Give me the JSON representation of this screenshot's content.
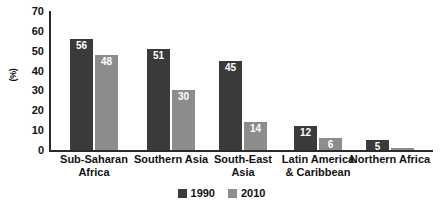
{
  "chart_data": {
    "type": "bar",
    "title": "",
    "xlabel": "",
    "ylabel": "(%)",
    "ylim": [
      0,
      70
    ],
    "yticks": [
      70,
      60,
      50,
      40,
      30,
      20,
      10,
      0
    ],
    "grid": false,
    "legend_position": "bottom-center",
    "categories": [
      "Sub-Saharan\nAfrica",
      "Southern Asia",
      "South-East\nAsia",
      "Latin America\n& Caribbean",
      "Northern Africa"
    ],
    "category_lines": [
      [
        "Sub-Saharan",
        "Africa"
      ],
      [
        "Southern Asia",
        ""
      ],
      [
        "South-East",
        "Asia"
      ],
      [
        "Latin America",
        "& Caribbean"
      ],
      [
        "Northern Africa",
        ""
      ]
    ],
    "series": [
      {
        "name": "1990",
        "color": "#3a3a3a",
        "values": [
          56,
          51,
          45,
          12,
          5
        ]
      },
      {
        "name": "2010",
        "color": "#8c8c8c",
        "values": [
          48,
          30,
          14,
          6,
          0
        ]
      }
    ],
    "value_labels": {
      "series_1990": [
        "56",
        "51",
        "45",
        "12",
        "5"
      ],
      "series_2010": [
        "48",
        "30",
        "14",
        "6",
        ""
      ]
    }
  },
  "legend": {
    "items": [
      {
        "label": "1990",
        "color": "#3a3a3a"
      },
      {
        "label": "2010",
        "color": "#8c8c8c"
      }
    ]
  },
  "axis": {
    "y_title": "(%)",
    "y_tick_labels": [
      "70",
      "60",
      "50",
      "40",
      "30",
      "20",
      "10",
      "0"
    ]
  }
}
